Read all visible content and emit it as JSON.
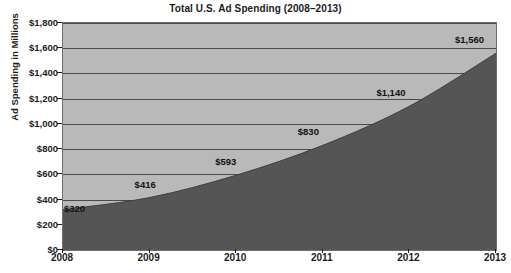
{
  "chart_data": {
    "type": "area",
    "title": "Total U.S. Ad Spending (2008–2013)",
    "xlabel": "",
    "ylabel": "Ad Spending in Millions",
    "categories": [
      "2008",
      "2009",
      "2010",
      "2011",
      "2012",
      "2013"
    ],
    "values": [
      320,
      416,
      593,
      830,
      1140,
      1560
    ],
    "point_labels": [
      "$320",
      "$416",
      "$593",
      "$830",
      "$1,140",
      "$1,560"
    ],
    "ylim": [
      0,
      1800
    ],
    "ytick_values": [
      0,
      200,
      400,
      600,
      800,
      1000,
      1200,
      1400,
      1600,
      1800
    ],
    "ytick_labels": [
      "$0",
      "$200",
      "$400",
      "$600",
      "$800",
      "$1,000",
      "$1,200",
      "$1,400",
      "$1,600",
      "$1,800"
    ],
    "grid": true,
    "legend": false,
    "colors": {
      "area_fill": "#555555",
      "plot_background": "#b9b9b9",
      "gridline": "#4a4a4a",
      "axis": "#1c1c1c",
      "text": "#1c1c1c",
      "page_background": "#ffffff"
    }
  }
}
